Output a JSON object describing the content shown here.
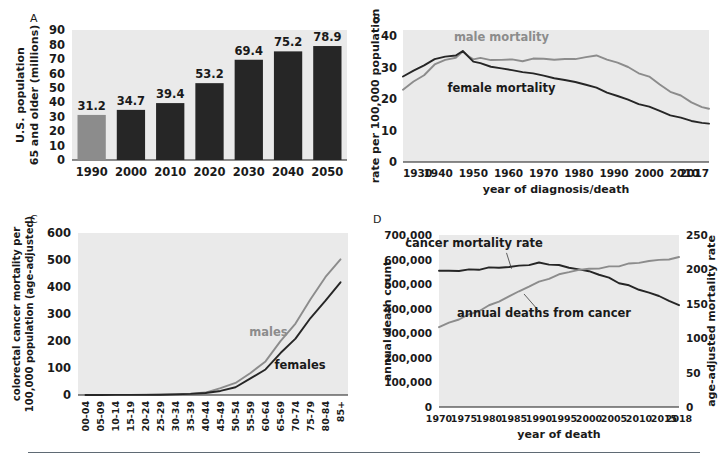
{
  "figure": {
    "panels": [
      "A",
      "B",
      "C",
      "D"
    ],
    "colors": {
      "plot_background": "#eaeaea",
      "dark_series": "#262626",
      "gray_series": "#8c8c8c",
      "gray_bar": "#8c8c8c",
      "dark_bar": "#262626",
      "rule": "#5f6a74"
    }
  },
  "chart_data": [
    {
      "panel": "A",
      "type": "bar",
      "title": "",
      "xlabel": "",
      "ylabel": "U.S. population 65 and older (millions)",
      "ylabel_lines": [
        "U.S. population",
        "65 and older (millions)"
      ],
      "categories": [
        "1990",
        "2000",
        "2010",
        "2020",
        "2030",
        "2040",
        "2050"
      ],
      "values": [
        31.2,
        34.7,
        39.4,
        53.2,
        69.4,
        75.2,
        78.9
      ],
      "value_labels": [
        "31.2",
        "34.7",
        "39.4",
        "53.2",
        "69.4",
        "75.2",
        "78.9"
      ],
      "bar_colors": [
        "#8c8c8c",
        "#262626",
        "#262626",
        "#262626",
        "#262626",
        "#262626",
        "#262626"
      ],
      "yticks": [
        0,
        10,
        20,
        30,
        40,
        50,
        60,
        70,
        80,
        90
      ],
      "ytick_labels": [
        "0",
        "10",
        "20",
        "30",
        "40",
        "50",
        "60",
        "70",
        "80",
        "90"
      ],
      "ylim": [
        0,
        90
      ],
      "grid": false,
      "legend": "none"
    },
    {
      "panel": "B",
      "type": "line",
      "title": "",
      "xlabel": "year of diagnosis/death",
      "ylabel": "rate per 100,000 population",
      "yticks": [
        0,
        10,
        20,
        30,
        40
      ],
      "ytick_labels": [
        "0",
        "10",
        "20",
        "30",
        "40"
      ],
      "ylim": [
        0,
        42
      ],
      "xlim": [
        1930,
        2017
      ],
      "xtick_labels": [
        "1930",
        "1940",
        "1950",
        "1960",
        "1970",
        "1980",
        "1990",
        "2000",
        "2010",
        "2017"
      ],
      "xticks": [
        1930,
        1940,
        1950,
        1960,
        1970,
        1980,
        1990,
        2000,
        2010,
        2017
      ],
      "grid": false,
      "legend": "inline-annotation",
      "series": [
        {
          "name": "male mortality",
          "color": "#8c8c8c",
          "label_x": 1958,
          "label_y": 38.5,
          "x": [
            1930,
            1933,
            1936,
            1939,
            1942,
            1945,
            1947,
            1949,
            1950,
            1952,
            1955,
            1958,
            1961,
            1964,
            1967,
            1970,
            1973,
            1976,
            1979,
            1982,
            1985,
            1988,
            1991,
            1994,
            1997,
            2000,
            2003,
            2006,
            2009,
            2012,
            2015,
            2017
          ],
          "values": [
            23.0,
            25.5,
            28.0,
            30.8,
            32.3,
            33.4,
            35.0,
            33.6,
            32.8,
            32.7,
            32.6,
            32.5,
            32.6,
            32.4,
            32.6,
            32.7,
            32.8,
            32.6,
            33.0,
            33.4,
            33.5,
            32.8,
            31.6,
            30.2,
            28.5,
            26.8,
            24.6,
            22.6,
            21.0,
            19.2,
            17.4,
            16.6
          ]
        },
        {
          "name": "female mortality",
          "color": "#262626",
          "label_x": 1958,
          "label_y": 22.2,
          "x": [
            1930,
            1933,
            1936,
            1939,
            1942,
            1945,
            1947,
            1949,
            1950,
            1952,
            1955,
            1958,
            1961,
            1964,
            1967,
            1970,
            1973,
            1976,
            1979,
            1982,
            1985,
            1988,
            1991,
            1994,
            1997,
            2000,
            2003,
            2006,
            2009,
            2012,
            2015,
            2017
          ],
          "values": [
            27.2,
            29.0,
            31.0,
            32.6,
            33.4,
            34.0,
            35.2,
            33.2,
            32.0,
            31.2,
            30.4,
            29.8,
            29.2,
            28.8,
            28.0,
            27.4,
            26.8,
            26.0,
            25.6,
            24.6,
            23.4,
            22.2,
            21.0,
            19.8,
            18.6,
            17.4,
            16.2,
            15.0,
            14.0,
            13.2,
            12.4,
            12.0
          ]
        }
      ]
    },
    {
      "panel": "C",
      "type": "line",
      "title": "",
      "xlabel": "",
      "ylabel": "colorectal cancer mortality per 100,000 population (age-adjusted)",
      "ylabel_lines": [
        "colorectal cancer mortality per",
        "100,000 population (age-adjusted)"
      ],
      "categories": [
        "00-04",
        "05-09",
        "10-14",
        "15-19",
        "20-24",
        "25-29",
        "30-34",
        "35-39",
        "40-44",
        "45-49",
        "50-54",
        "55-59",
        "60-64",
        "65-69",
        "70-74",
        "75-79",
        "80-84",
        "85+"
      ],
      "yticks": [
        0,
        100,
        200,
        300,
        400,
        500,
        600
      ],
      "ytick_labels": [
        "0",
        "100",
        "200",
        "300",
        "400",
        "500",
        "600"
      ],
      "ylim": [
        0,
        600
      ],
      "grid": false,
      "legend": "inline-annotation",
      "series": [
        {
          "name": "males",
          "color": "#8c8c8c",
          "label_index": 12.2,
          "label_value": 218,
          "values": [
            0.2,
            0.2,
            0.3,
            0.4,
            0.7,
            1.3,
            2.5,
            4.5,
            9.0,
            22.0,
            48.0,
            78.0,
            128.0,
            196.0,
            268.0,
            352.0,
            440.0,
            500.0
          ]
        },
        {
          "name": "females",
          "color": "#262626",
          "label_index": 14.3,
          "label_value": 98,
          "values": [
            0.2,
            0.2,
            0.3,
            0.4,
            0.6,
            1.1,
            2.2,
            4.0,
            7.5,
            15.0,
            32.0,
            58.0,
            98.0,
            152.0,
            212.0,
            282.0,
            352.0,
            415.0
          ]
        }
      ]
    },
    {
      "panel": "D",
      "type": "line",
      "title": "",
      "xlabel": "year of death",
      "ylabel": "annual death count",
      "ylabel_right": "age-adjusted mortality rate",
      "yticks": [
        0,
        100000,
        200000,
        300000,
        400000,
        500000,
        600000,
        700000
      ],
      "ytick_labels": [
        "0",
        "100,000",
        "200,000",
        "300,000",
        "400,000",
        "500,000",
        "600,000",
        "700,000"
      ],
      "ylim": [
        0,
        700000
      ],
      "yticks_right": [
        0,
        50,
        100,
        150,
        200,
        250
      ],
      "ytick_labels_right": [
        "0",
        "50",
        "100",
        "150",
        "200",
        "250"
      ],
      "ylim_right": [
        0,
        250
      ],
      "xlim": [
        1970,
        2018
      ],
      "xticks": [
        1970,
        1975,
        1980,
        1985,
        1990,
        1995,
        2000,
        2005,
        2010,
        2015,
        2018
      ],
      "xtick_labels": [
        "1970",
        "1975",
        "1980",
        "1985",
        "1990",
        "1995",
        "2000",
        "2005",
        "2010",
        "2015",
        "2018"
      ],
      "grid": false,
      "legend": "inline-annotation",
      "series": [
        {
          "name": "cancer mortality rate",
          "color": "#262626",
          "axis": "right",
          "label_x": 1977,
          "label_y": 232,
          "leader_from_x": 1983.5,
          "leader_from_y": 224,
          "leader_to_x": 1984.5,
          "leader_to_y": 201,
          "x": [
            1970,
            1972,
            1974,
            1976,
            1978,
            1980,
            1982,
            1984,
            1986,
            1988,
            1990,
            1992,
            1994,
            1996,
            1998,
            2000,
            2002,
            2004,
            2006,
            2008,
            2010,
            2012,
            2014,
            2016,
            2018
          ],
          "values": [
            198.0,
            197.5,
            198.5,
            199.0,
            200.5,
            202.0,
            203.0,
            203.5,
            205.0,
            207.0,
            209.0,
            208.0,
            205.5,
            203.0,
            200.0,
            197.0,
            193.0,
            187.0,
            181.0,
            176.0,
            171.0,
            166.0,
            161.0,
            155.0,
            147.0
          ]
        },
        {
          "name": "annual deaths from cancer",
          "color": "#8c8c8c",
          "axis": "left",
          "label_x": 1991,
          "label_y": 368000,
          "leader_from_x": 1990,
          "leader_from_y": 390000,
          "leader_to_x": 1987,
          "leader_to_y": 460000,
          "x": [
            1970,
            1972,
            1974,
            1976,
            1978,
            1980,
            1982,
            1984,
            1986,
            1988,
            1990,
            1992,
            1994,
            1996,
            1998,
            2000,
            2002,
            2004,
            2006,
            2008,
            2010,
            2012,
            2014,
            2016,
            2018
          ],
          "values": [
            325000,
            342000,
            358000,
            375000,
            392000,
            412000,
            430000,
            450000,
            470000,
            492000,
            508000,
            524000,
            538000,
            550000,
            558000,
            562000,
            565000,
            570000,
            575000,
            582000,
            588000,
            594000,
            598000,
            602000,
            608000
          ]
        }
      ]
    }
  ]
}
